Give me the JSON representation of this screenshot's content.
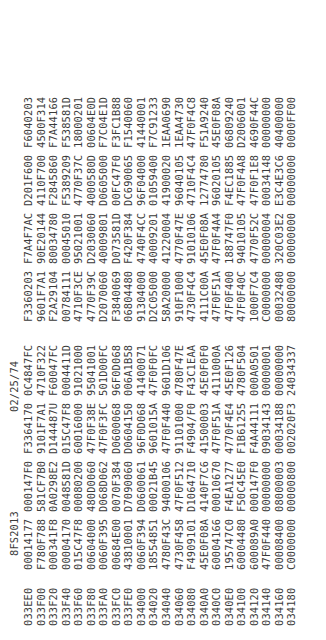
{
  "header": {
    "title": "8FS2013",
    "date": "02/25/74"
  },
  "rows": [
    {
      "addr": "033EE0",
      "words": [
        "00014177",
        "000147F0",
        "F3364170",
        "0C4847FC",
        "F3360203",
        "F7A4F7AC",
        "D201F600",
        "F6040203"
      ]
    },
    {
      "addr": "033F00",
      "words": [
        "F780F788",
        "581CF7B0",
        "9101F7A1",
        "4710F322",
        "9601F7A1",
        "90E20144",
        "4110F700",
        "4500F314"
      ]
    },
    {
      "addr": "033F20",
      "words": [
        "000341F8",
        "0A0298E2",
        "D144487U",
        "F60047FC",
        "F2A29104",
        "80034780",
        "F2845860",
        "F7A44166"
      ]
    },
    {
      "addr": "033F40",
      "words": [
        "00004170",
        "0048581D",
        "015C47F8",
        "0004411D",
        "00784111",
        "00045010",
        "F5389209",
        "F538581D"
      ]
    },
    {
      "addr": "033F60",
      "words": [
        "015C47F8",
        "00080200",
        "60016000",
        "91021000",
        "4710F3CE",
        "95021001",
        "4770F37C",
        "18000201"
      ]
    },
    {
      "addr": "033F80",
      "words": [
        "00604000",
        "480D0060",
        "47F0F38E",
        "95041001",
        "4770F39C",
        "D2030060",
        "4000580D",
        "00604E0D"
      ]
    },
    {
      "addr": "033FA0",
      "words": [
        "0060F395",
        "D068D062",
        "47F0F3FC",
        "501D00FC",
        "D2070060",
        "40009801",
        "D0605000",
        "F7C04E1D"
      ]
    },
    {
      "addr": "033FC0",
      "words": [
        "00684E00",
        "0070F384",
        "D0600068",
        "96F0D068",
        "F3840069",
        "D073581D",
        "00FC47F0",
        "F3FC1B88"
      ]
    },
    {
      "addr": "033FE0",
      "words": [
        "43810001",
        "D7090060",
        "D0604150",
        "006A1B58",
        "06804480",
        "F420F384",
        "DC690065",
        "F1540060"
      ]
    },
    {
      "addr": "034000",
      "words": [
        "0060F394",
        "D0600061",
        "96F0D068",
        "41400071",
        "91304000",
        "4740F4CC",
        "96F04000",
        "41440001"
      ]
    },
    {
      "addr": "034020",
      "words": [
        "18554851",
        "00021B45",
        "9601015A",
        "47F0F0FC",
        "D2C05000",
        "40009201",
        "01059400",
        "F7C91233"
      ]
    },
    {
      "addr": "034040",
      "words": [
        "4780F43C",
        "94000106",
        "47F0F440",
        "9601D106",
        "58A20000",
        "41220004",
        "41900020",
        "1EAA0690"
      ]
    },
    {
      "addr": "034060",
      "words": [
        "4730F458",
        "47F0F512",
        "91101000",
        "4780F47E",
        "910F1000",
        "4770F47E",
        "96040105",
        "1EAA4730"
      ]
    },
    {
      "addr": "034080",
      "words": [
        "F4909101",
        "D1064710",
        "F4904/F0",
        "F43C1EAA",
        "4730F4C4",
        "91010106",
        "4710F4C4",
        "47F0F4C8"
      ]
    },
    {
      "addr": "0340A0",
      "words": [
        "45E0F08A",
        "4140F7C6",
        "41500003",
        "45E0F0F0",
        "4111C00A",
        "45E0F08A",
        "12774780",
        "F51A9240"
      ]
    },
    {
      "addr": "0340C0",
      "words": [
        "60004166",
        "00010670",
        "47F0F51A",
        "4111000A",
        "47F0F51A",
        "47F0F4A4",
        "96020105",
        "45E0F08A"
      ]
    },
    {
      "addr": "0340E0",
      "words": [
        "195747C0",
        "F4EA1277",
        "4770F4E4",
        "45E0F126",
        "47F0F400",
        "188747F0",
        "F4EC1885",
        "06809240"
      ]
    },
    {
      "addr": "034100",
      "words": [
        "60004480",
        "F50C45E0",
        "F1B61255",
        "4780F504",
        "47F0F40C",
        "94010105",
        "47F0F4A8",
        "D2006001"
      ]
    },
    {
      "addr": "034120",
      "words": [
        "600089A0",
        "000147F0",
        "F4A44111",
        "000A0501",
        "1000F7C4",
        "4770F52C",
        "47F0F1E8",
        "4690F44C"
      ]
    },
    {
      "addr": "034140",
      "words": [
        "47F0F440",
        "00000000",
        "09034143",
        "00000001",
        "C0000000",
        "00000004",
        "00034148",
        "00000000"
      ]
    },
    {
      "addr": "034160",
      "words": [
        "00008400",
        "08000003",
        "00034188",
        "00000000",
        "00032480",
        "320C03E2",
        "E3C4E3C6",
        "40400000"
      ]
    },
    {
      "addr": "034180",
      "words": [
        "C0000000",
        "00000800",
        "002020F3",
        "24034337",
        "80000000",
        "00000000",
        "00000000",
        "0000FF00"
      ]
    }
  ]
}
